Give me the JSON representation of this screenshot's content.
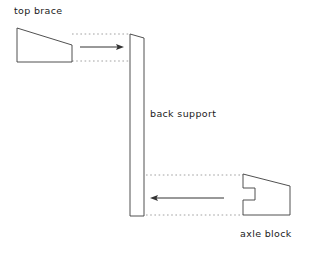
{
  "diagram": {
    "background_color": "#ffffff",
    "line_color": "#3c3c3c",
    "guide_color": "#8a8a8a",
    "arrow_color": "#333333",
    "parts": [
      {
        "id": "top-brace",
        "label": "top brace",
        "shape": "quadrilateral with slanted top edge",
        "points": "17,28 17,62 72,62 72,45",
        "label_position": {
          "left": 14,
          "top": 6
        }
      },
      {
        "id": "back-support",
        "label": "back support",
        "shape": "tall tapered vertical panel",
        "points": "130,34 144,38 144,216 130,216",
        "label_position": {
          "left": 150,
          "top": 109
        }
      },
      {
        "id": "axle-block",
        "label": "axle block",
        "shape": "block with rectangular notch on left edge",
        "points": "243,174 243,188 255,188 255,200 243,200 243,215 290,215 290,186",
        "label_position": {
          "left": 240,
          "top": 229
        }
      }
    ],
    "motion_arrows": [
      {
        "id": "top-brace-insertion-arrow",
        "direction": "right",
        "from_x": 80,
        "to_x": 124,
        "y": 47,
        "describes": "top brace slides right into back support"
      },
      {
        "id": "axle-block-insertion-arrow",
        "direction": "left",
        "from_x": 224,
        "to_x": 150,
        "y": 198,
        "describes": "axle block slides left into back support"
      }
    ],
    "guide_lines": [
      {
        "id": "top-brace-guide-upper",
        "x1": 72,
        "y1": 34,
        "x2": 130,
        "y2": 34
      },
      {
        "id": "top-brace-guide-lower",
        "x1": 72,
        "y1": 61,
        "x2": 130,
        "y2": 61
      },
      {
        "id": "axle-block-guide-upper",
        "x1": 146,
        "y1": 175,
        "x2": 243,
        "y2": 175
      },
      {
        "id": "axle-block-guide-lower",
        "x1": 146,
        "y1": 215,
        "x2": 243,
        "y2": 215
      }
    ]
  }
}
